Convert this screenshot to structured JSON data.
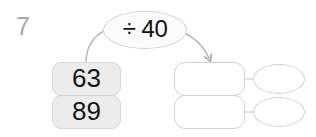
{
  "worksheet": {
    "question_number": "7",
    "operation": {
      "label": "÷ 40",
      "icon": "divide-icon"
    },
    "inputs": [
      {
        "value": "63"
      },
      {
        "value": "89"
      }
    ],
    "outputs": [
      {
        "box_value": "",
        "oval_value": ""
      },
      {
        "box_value": "",
        "oval_value": ""
      }
    ],
    "colors": {
      "background": "#ffffff",
      "input_box_fill": "#ececec",
      "input_box_border": "#d6d6d6",
      "output_box_fill": "#ffffff",
      "output_box_border": "#cfcfcf",
      "bubble_fill": "#fbfbfb",
      "bubble_border": "#d2d2d2",
      "text": "#161616",
      "question_number": "#a8a8a8",
      "arrow": "#b4b4b4"
    }
  }
}
